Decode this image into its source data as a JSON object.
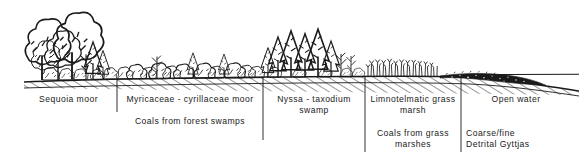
{
  "figure": {
    "type": "cross-section-profile",
    "ink_color": "#1a1a1a",
    "background_color": "#ffffff",
    "width": 579,
    "height": 161
  },
  "zones": [
    {
      "id": "sequoia",
      "vegetation_label": "Sequoia  moor",
      "product_label": "",
      "x_start": 20,
      "x_end": 117,
      "drawing": "tall broad-crowned trees"
    },
    {
      "id": "myricaceae",
      "vegetation_label": "Myricaceae - cyrillaceae  moor",
      "product_label": "Coals  from  forest  swamps",
      "x_start": 117,
      "x_end": 263,
      "drawing": "low dense shrubs with scattered conifers"
    },
    {
      "id": "nyssa",
      "vegetation_label": "Nyssa - taxodium\nswamp",
      "product_label": "",
      "x_start": 263,
      "x_end": 365,
      "drawing": "conical swamp trees"
    },
    {
      "id": "limnotelmatic",
      "vegetation_label": "Limnotelmatic  grass\nmarsh",
      "product_label": "Coals  from  grass\nmarshes",
      "x_start": 365,
      "x_end": 461,
      "drawing": "thin vertical reed and grass strokes"
    },
    {
      "id": "openwater",
      "vegetation_label": "Open  water",
      "product_label": "Coarse/fine\nDetrital  Gyttjas",
      "x_start": 461,
      "x_end": 579,
      "drawing": "dark stippled gyttja wedge below water line"
    }
  ],
  "dividers": [
    117,
    263,
    365,
    461
  ],
  "features": {
    "ground_line": "hatched substrate sloping gently down to the right",
    "water_line": "horizontal open-water surface on the right",
    "gyttja_lens": "dark stippled detrital lens tapering basinward"
  }
}
